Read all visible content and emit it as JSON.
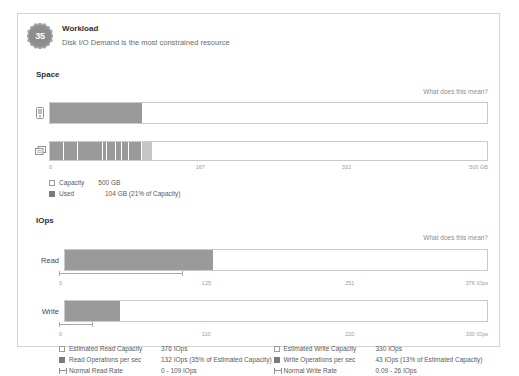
{
  "header": {
    "score": "35",
    "title": "Workload",
    "subtitle": "Disk I/O Demand is the most constrained resource"
  },
  "space": {
    "section_title": "Space",
    "explain_link": "What does this mean?",
    "capacity_icon": "disk-icon",
    "datastore_icon": "datastore-icon",
    "usage_bar": {
      "percent": 21
    },
    "datastore_bar": {
      "segments": [
        3.1,
        3.4,
        5.6,
        1.0,
        1.9,
        1.4,
        1.6,
        3.0
      ],
      "light_tail": 2.4
    },
    "axis": {
      "ticks": [
        "0",
        "167",
        "332",
        "500 GB"
      ],
      "positions": [
        0,
        33.4,
        66.7,
        100
      ]
    },
    "legend": [
      {
        "swatch": "outline",
        "name": "Capacity",
        "value": "500 GB"
      },
      {
        "swatch": "solid",
        "name": "Used",
        "value": "104 GB (21% of Capacity)"
      }
    ]
  },
  "iops": {
    "section_title": "IOps",
    "explain_link": "What does this mean?",
    "read": {
      "label": "Read",
      "percent": 35,
      "bracket_start": 0,
      "bracket_end": 29,
      "axis": {
        "ticks": [
          "0",
          "125",
          "251",
          "376 IOps"
        ],
        "positions": [
          0,
          33.3,
          66.7,
          100
        ]
      }
    },
    "write": {
      "label": "Write",
      "percent": 13,
      "bracket_start": 0,
      "bracket_end": 7.9,
      "axis": {
        "ticks": [
          "0",
          "110",
          "220",
          "330 IOps"
        ],
        "positions": [
          0,
          33.3,
          66.7,
          100
        ]
      }
    },
    "legend_read": [
      {
        "swatch": "outline",
        "name": "Estimated Read Capacity",
        "value": "376 IOps"
      },
      {
        "swatch": "solid",
        "name": "Read Operations per sec",
        "value": "132 IOps (35% of Estimated Capacity)"
      },
      {
        "swatch": "range",
        "name": "Normal Read Rate",
        "value": "0 - 109 IOps"
      }
    ],
    "legend_write": [
      {
        "swatch": "outline",
        "name": "Estimated Write Capacity",
        "value": "330 IOps"
      },
      {
        "swatch": "solid",
        "name": "Write Operations per sec",
        "value": "43 IOps (13% of Estimated Capacity)"
      },
      {
        "swatch": "range",
        "name": "Normal Write Rate",
        "value": "0.09 - 26 IOps"
      }
    ]
  },
  "colors": {
    "bar_fill": "#9a9a9a",
    "bar_fill_light": "#c6c6c6",
    "border": "#c9c9c9",
    "text": "#3b3b3b",
    "muted": "#9b9b9b"
  }
}
